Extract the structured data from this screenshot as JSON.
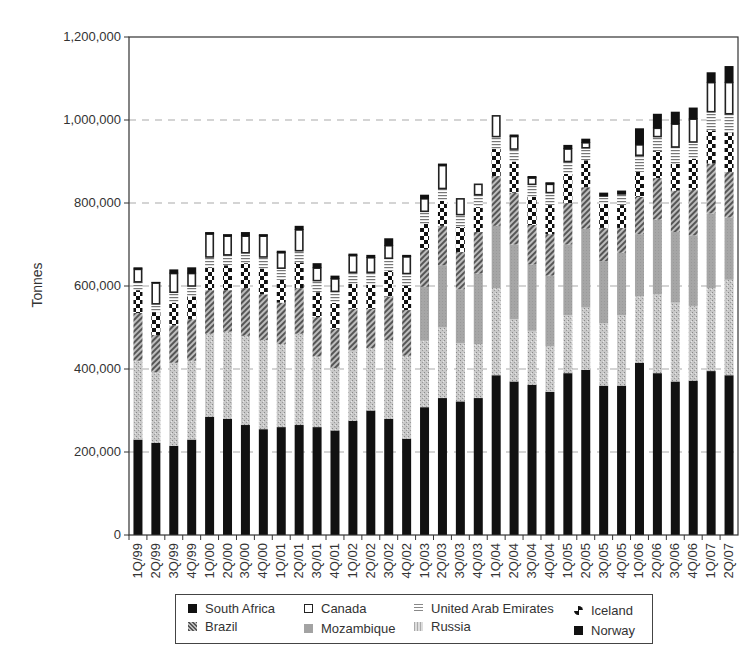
{
  "chart_data": {
    "type": "bar",
    "stacked": true,
    "title": "",
    "xlabel": "",
    "ylabel": "Tonnes",
    "ylim": [
      0,
      1200000
    ],
    "yticks": [
      0,
      200000,
      400000,
      600000,
      800000,
      1000000,
      1200000
    ],
    "ytick_labels": [
      "0",
      "200,000",
      "400,000",
      "600,000",
      "800,000",
      "1,000,000",
      "1,200,000"
    ],
    "grid": "horizontal dashed at 200,000 intervals",
    "legend_position": "bottom",
    "categories": [
      "1Q/99",
      "2Q/99",
      "3Q/99",
      "4Q/99",
      "1Q/00",
      "2Q/00",
      "3Q/00",
      "4Q/00",
      "1Q/01",
      "2Q/01",
      "3Q/01",
      "4Q/01",
      "1Q/02",
      "2Q/02",
      "3Q/02",
      "4Q/02",
      "1Q/03",
      "2Q/03",
      "3Q/03",
      "4Q/03",
      "1Q/04",
      "2Q/04",
      "3Q/04",
      "4Q/04",
      "1Q/05",
      "2Q/05",
      "3Q/05",
      "4Q/05",
      "1Q/06",
      "2Q/06",
      "3Q/06",
      "4Q/06",
      "1Q/07",
      "2Q/07"
    ],
    "series": [
      {
        "name": "South Africa",
        "pattern": "solid-black",
        "values": [
          230000,
          222000,
          215000,
          230000,
          285000,
          280000,
          265000,
          255000,
          260000,
          265000,
          260000,
          252000,
          275000,
          300000,
          280000,
          232000,
          308000,
          330000,
          322000,
          330000,
          385000,
          370000,
          362000,
          345000,
          390000,
          398000,
          360000,
          360000,
          415000,
          390000,
          370000,
          372000,
          395000,
          385000
        ]
      },
      {
        "name": "Russia",
        "pattern": "light-speckle",
        "values": [
          190000,
          170000,
          200000,
          190000,
          200000,
          210000,
          215000,
          215000,
          200000,
          220000,
          170000,
          150000,
          170000,
          150000,
          190000,
          200000,
          160000,
          170000,
          140000,
          130000,
          210000,
          150000,
          130000,
          110000,
          140000,
          150000,
          150000,
          170000,
          160000,
          190000,
          190000,
          180000,
          200000,
          230000
        ]
      },
      {
        "name": "Mozambique",
        "pattern": "medium-gray",
        "values": [
          0,
          0,
          0,
          0,
          0,
          0,
          0,
          0,
          0,
          0,
          0,
          0,
          0,
          0,
          0,
          0,
          130000,
          150000,
          130000,
          170000,
          150000,
          180000,
          160000,
          170000,
          170000,
          190000,
          150000,
          150000,
          150000,
          180000,
          170000,
          170000,
          180000,
          150000
        ]
      },
      {
        "name": "Brazil",
        "pattern": "diagonal-hatch",
        "values": [
          115000,
          90000,
          90000,
          100000,
          105000,
          100000,
          115000,
          110000,
          100000,
          110000,
          95000,
          95000,
          100000,
          95000,
          105000,
          110000,
          90000,
          95000,
          90000,
          100000,
          120000,
          125000,
          95000,
          100000,
          100000,
          100000,
          80000,
          60000,
          90000,
          100000,
          100000,
          110000,
          120000,
          110000
        ]
      },
      {
        "name": "Iceland",
        "pattern": "checker",
        "values": [
          55000,
          55000,
          55000,
          55000,
          55000,
          60000,
          60000,
          62000,
          55000,
          62000,
          60000,
          62000,
          60000,
          58000,
          62000,
          58000,
          62000,
          60000,
          60000,
          60000,
          65000,
          75000,
          68000,
          70000,
          70000,
          65000,
          58000,
          55000,
          60000,
          65000,
          65000,
          75000,
          80000,
          95000
        ]
      },
      {
        "name": "United Arab Emirates",
        "pattern": "horizontal-lines",
        "values": [
          20000,
          20000,
          25000,
          25000,
          25000,
          25000,
          25000,
          28000,
          28000,
          28000,
          28000,
          28000,
          28000,
          30000,
          30000,
          30000,
          30000,
          30000,
          30000,
          30000,
          30000,
          30000,
          30000,
          30000,
          30000,
          30000,
          17000,
          25000,
          40000,
          35000,
          40000,
          40000,
          45000,
          45000
        ]
      },
      {
        "name": "Canada",
        "pattern": "white-box",
        "values": [
          30000,
          50000,
          45000,
          30000,
          55000,
          45000,
          40000,
          50000,
          37000,
          50000,
          30000,
          30000,
          40000,
          35000,
          30000,
          40000,
          30000,
          55000,
          38000,
          25000,
          50000,
          30000,
          15000,
          20000,
          30000,
          12000,
          0,
          0,
          25000,
          20000,
          55000,
          55000,
          70000,
          75000
        ]
      },
      {
        "name": "Norway",
        "pattern": "solid-black",
        "values": [
          5000,
          3000,
          10000,
          15000,
          5000,
          5000,
          10000,
          5000,
          5000,
          10000,
          12000,
          8000,
          5000,
          7000,
          18000,
          5000,
          10000,
          5000,
          0,
          0,
          0,
          5000,
          5000,
          5000,
          10000,
          10000,
          10000,
          10000,
          40000,
          35000,
          30000,
          28000,
          25000,
          40000
        ]
      }
    ]
  },
  "legend": {
    "items": [
      {
        "label": "South Africa"
      },
      {
        "label": "Canada"
      },
      {
        "label": "United Arab Emirates"
      },
      {
        "label": "Iceland"
      },
      {
        "label": "Brazil"
      },
      {
        "label": "Mozambique"
      },
      {
        "label": "Russia"
      },
      {
        "label": "Norway"
      }
    ]
  }
}
